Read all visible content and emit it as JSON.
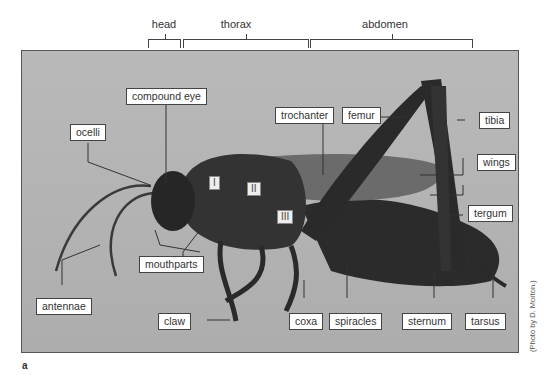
{
  "regions": [
    {
      "label": "head"
    },
    {
      "label": "thorax"
    },
    {
      "label": "abdomen"
    }
  ],
  "callouts": {
    "compound_eye": "compound eye",
    "ocelli": "ocelli",
    "trochanter": "trochanter",
    "femur": "femur",
    "tibia": "tibia",
    "wings": "wings",
    "tergum": "tergum",
    "mouthparts": "mouthparts",
    "antennae": "antennae",
    "claw": "claw",
    "coxa": "coxa",
    "spiracles": "spiracles",
    "sternum": "sternum",
    "tarsus": "tarsus"
  },
  "thoracic_segments": [
    "I",
    "II",
    "III"
  ],
  "credit": "(Photo by D. Morton.)",
  "figure_label": "a"
}
